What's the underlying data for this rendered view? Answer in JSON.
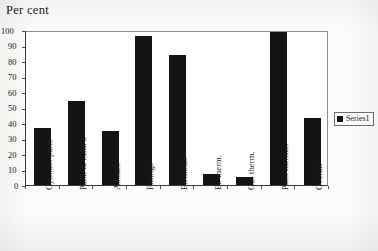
{
  "figure": {
    "axis_title": "Per cent",
    "background_color": "#fcfcfb",
    "bar_color": "#141414",
    "axis_color": "#3a3a3a"
  },
  "legend": {
    "position": "right",
    "entries": [
      {
        "label": "Series1",
        "color": "#141414",
        "marker": "square-marker"
      }
    ]
  },
  "chart_data": {
    "type": "bar",
    "title": "Per cent",
    "xlabel": "",
    "ylabel": "Per cent",
    "ylim": [
      0,
      100
    ],
    "ytick_step": 10,
    "ytick_labels": [
      "0",
      "10",
      "20",
      "30",
      "40",
      "50",
      "60",
      "70",
      "80",
      "90",
      "100"
    ],
    "grid": false,
    "legend_position": "right",
    "categories": [
      "Cylinder parts",
      "Paint & insul'n",
      "Anodes",
      "Fittings",
      "Elements",
      "El. therm.",
      "Gas therm.",
      "Pilot thermo.",
      "Overall"
    ],
    "series": [
      {
        "name": "Series1",
        "color": "#141414",
        "values": [
          37,
          54,
          35,
          96,
          84,
          7,
          5,
          99,
          43
        ]
      }
    ]
  }
}
